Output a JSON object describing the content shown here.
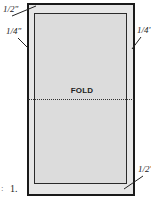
{
  "diagram": {
    "step_number": "1.",
    "step_prefix": ":",
    "fold_label": "FOLD",
    "measurements": {
      "top_left": "1/2\"",
      "left": "1/4\"",
      "right": "1/4'",
      "bottom_right": "1/2'"
    },
    "colors": {
      "outer_fill": "#e6e6e6",
      "inner_fill": "#dcdcdc",
      "line": "#1a1a1a"
    }
  }
}
